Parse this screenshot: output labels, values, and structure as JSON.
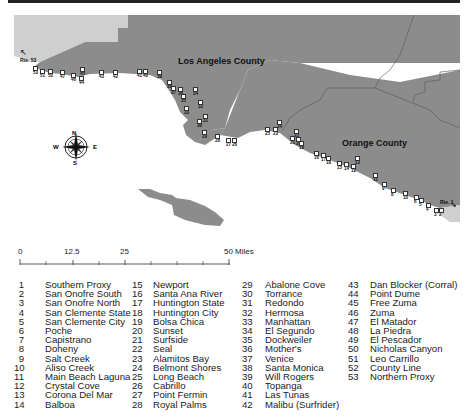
{
  "map": {
    "counties": [
      {
        "label": "Los Angeles County"
      },
      {
        "label": "Orange County"
      }
    ],
    "road_markers": [
      {
        "label": "Rte. 53",
        "position": "northwest"
      },
      {
        "label": "Rte. 1",
        "position": "southeast"
      }
    ],
    "compass": {
      "n": "N",
      "s": "S",
      "e": "E",
      "w": "W"
    },
    "colors": {
      "county_fill": "#8c8c8c",
      "outside_fill": "#cfcfcf",
      "water": "#ffffff",
      "border": "#555555"
    }
  },
  "scale_bar": {
    "ticks": [
      "0",
      "12.5",
      "25",
      "50 Miles"
    ]
  },
  "legend": {
    "columns": [
      [
        {
          "num": "1",
          "name": "Southern Proxy"
        },
        {
          "num": "2",
          "name": "San Onofre South"
        },
        {
          "num": "3",
          "name": "San Onofre North"
        },
        {
          "num": "4",
          "name": "San Clemente State"
        },
        {
          "num": "5",
          "name": "San Clemente City"
        },
        {
          "num": "6",
          "name": "Poche"
        },
        {
          "num": "7",
          "name": "Capistrano"
        },
        {
          "num": "8",
          "name": "Doheny"
        },
        {
          "num": "9",
          "name": "Salt Creek"
        },
        {
          "num": "10",
          "name": "Aliso Creek"
        },
        {
          "num": "11",
          "name": "Main Beach Laguna"
        },
        {
          "num": "12",
          "name": "Crystal Cove"
        },
        {
          "num": "13",
          "name": "Corona Del Mar"
        },
        {
          "num": "14",
          "name": "Balboa"
        }
      ],
      [
        {
          "num": "15",
          "name": "Newport"
        },
        {
          "num": "16",
          "name": "Santa Ana River"
        },
        {
          "num": "17",
          "name": "Huntington State"
        },
        {
          "num": "18",
          "name": "Huntington City"
        },
        {
          "num": "19",
          "name": "Bolsa Chica"
        },
        {
          "num": "20",
          "name": "Sunset"
        },
        {
          "num": "21",
          "name": "Surfside"
        },
        {
          "num": "22",
          "name": "Seal"
        },
        {
          "num": "23",
          "name": "Alamitos Bay"
        },
        {
          "num": "24",
          "name": "Belmont Shores"
        },
        {
          "num": "25",
          "name": "Long Beach"
        },
        {
          "num": "26",
          "name": "Cabrillo"
        },
        {
          "num": "27",
          "name": "Point Fermin"
        },
        {
          "num": "28",
          "name": "Royal Palms"
        }
      ],
      [
        {
          "num": "29",
          "name": "Abalone Cove"
        },
        {
          "num": "30",
          "name": "Torrance"
        },
        {
          "num": "31",
          "name": "Redondo"
        },
        {
          "num": "32",
          "name": "Hermosa"
        },
        {
          "num": "33",
          "name": "Manhattan"
        },
        {
          "num": "34",
          "name": "El Segundo"
        },
        {
          "num": "35",
          "name": "Dockweiler"
        },
        {
          "num": "36",
          "name": "Mother's"
        },
        {
          "num": "37",
          "name": "Venice"
        },
        {
          "num": "38",
          "name": "Santa Monica"
        },
        {
          "num": "39",
          "name": "Will Rogers"
        },
        {
          "num": "40",
          "name": "Topanga"
        },
        {
          "num": "41",
          "name": "Las Tunas"
        },
        {
          "num": "42",
          "name": "Malibu (Surfrider)"
        }
      ],
      [
        {
          "num": "43",
          "name": "Dan Blocker (Corral)"
        },
        {
          "num": "44",
          "name": "Point Dume"
        },
        {
          "num": "45",
          "name": "Free Zuma"
        },
        {
          "num": "46",
          "name": "Zuma"
        },
        {
          "num": "47",
          "name": "El Matador"
        },
        {
          "num": "48",
          "name": "La Piedra"
        },
        {
          "num": "49",
          "name": "El Pescador"
        },
        {
          "num": "50",
          "name": "Nicholas Canyon"
        },
        {
          "num": "51",
          "name": "Leo Carrillo"
        },
        {
          "num": "52",
          "name": "County Line"
        },
        {
          "num": "53",
          "name": "Northern Proxy"
        }
      ]
    ]
  },
  "site_labels": [
    {
      "id": "53",
      "x": 33,
      "y": 70
    },
    {
      "id": "51",
      "x": 40,
      "y": 73
    },
    {
      "id": "50",
      "x": 48,
      "y": 73
    },
    {
      "id": "47",
      "x": 60,
      "y": 74
    },
    {
      "id": "46",
      "x": 71,
      "y": 77
    },
    {
      "id": "45",
      "x": 80,
      "y": 71
    },
    {
      "id": "44",
      "x": 79,
      "y": 80
    },
    {
      "id": "43",
      "x": 99,
      "y": 74
    },
    {
      "id": "42",
      "x": 113,
      "y": 74
    },
    {
      "id": "41",
      "x": 137,
      "y": 73
    },
    {
      "id": "40",
      "x": 143,
      "y": 73
    },
    {
      "id": "39",
      "x": 157,
      "y": 74
    },
    {
      "id": "38",
      "x": 167,
      "y": 84
    },
    {
      "id": "37",
      "x": 171,
      "y": 90
    },
    {
      "id": "36",
      "x": 178,
      "y": 91
    },
    {
      "id": "34",
      "x": 193,
      "y": 91
    },
    {
      "id": "35",
      "x": 181,
      "y": 98
    },
    {
      "id": "33",
      "x": 184,
      "y": 110
    },
    {
      "id": "32",
      "x": 198,
      "y": 104
    },
    {
      "id": "31",
      "x": 203,
      "y": 118
    },
    {
      "id": "30",
      "x": 197,
      "y": 123
    },
    {
      "id": "29",
      "x": 202,
      "y": 134
    },
    {
      "id": "28",
      "x": 215,
      "y": 138
    },
    {
      "id": "27",
      "x": 226,
      "y": 142
    },
    {
      "id": "26",
      "x": 232,
      "y": 142
    },
    {
      "id": "25",
      "x": 265,
      "y": 131
    },
    {
      "id": "24",
      "x": 277,
      "y": 124
    },
    {
      "id": "23",
      "x": 273,
      "y": 131
    },
    {
      "id": "22",
      "x": 294,
      "y": 133
    },
    {
      "id": "21",
      "x": 290,
      "y": 140
    },
    {
      "id": "20",
      "x": 296,
      "y": 141
    },
    {
      "id": "19",
      "x": 299,
      "y": 145
    },
    {
      "id": "16",
      "x": 314,
      "y": 155
    },
    {
      "id": "17",
      "x": 321,
      "y": 157
    },
    {
      "id": "18",
      "x": 326,
      "y": 160
    },
    {
      "id": "15",
      "x": 337,
      "y": 165
    },
    {
      "id": "14",
      "x": 344,
      "y": 166
    },
    {
      "id": "13",
      "x": 355,
      "y": 160
    },
    {
      "id": "12",
      "x": 351,
      "y": 168
    },
    {
      "id": "11",
      "x": 373,
      "y": 177
    },
    {
      "id": "9",
      "x": 382,
      "y": 186
    },
    {
      "id": "8",
      "x": 391,
      "y": 192
    },
    {
      "id": "10",
      "x": 403,
      "y": 195
    },
    {
      "id": "6",
      "x": 414,
      "y": 199
    },
    {
      "id": "5",
      "x": 419,
      "y": 202
    },
    {
      "id": "4",
      "x": 426,
      "y": 207
    },
    {
      "id": "3",
      "x": 434,
      "y": 212
    },
    {
      "id": "2",
      "x": 439,
      "y": 212
    }
  ]
}
